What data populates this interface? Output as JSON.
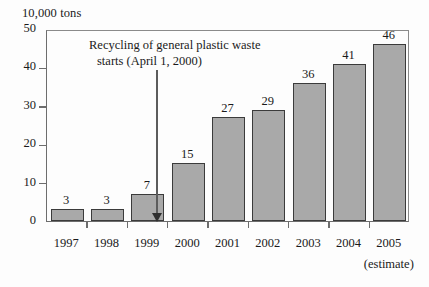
{
  "chart_data": {
    "type": "bar",
    "title": "",
    "xlabel": "",
    "ylabel": "10,000 tons",
    "categories": [
      "1997",
      "1998",
      "1999",
      "2000",
      "2001",
      "2002",
      "2003",
      "2004",
      "2005"
    ],
    "values": [
      3,
      3,
      7,
      15,
      27,
      29,
      36,
      41,
      46
    ],
    "ylim": [
      0,
      50
    ],
    "yticks": [
      0,
      10,
      20,
      30,
      40,
      50
    ],
    "grid": false,
    "legend": null,
    "bar_color": "#a9a9a9",
    "bar_border_color": "#3b3b3b",
    "axis_color": "#6d6d6d",
    "annotations": [
      {
        "line1": "Recycling of general plastic waste",
        "line2": "starts (April 1, 2000)",
        "points_to_category": "2000",
        "points_to_value": 0
      }
    ],
    "category_notes": [
      {
        "category": "2005",
        "note": "(estimate)"
      }
    ]
  },
  "axis": {
    "unit_label": "10,000 tons",
    "y_tick_labels": [
      "50",
      "40",
      "30",
      "20",
      "10",
      "0"
    ],
    "x_tick_labels": [
      "1997",
      "1998",
      "1999",
      "2000",
      "2001",
      "2002",
      "2003",
      "2004",
      "2005"
    ],
    "x_estimate_note": "(estimate)"
  },
  "bar_labels": [
    "3",
    "3",
    "7",
    "15",
    "27",
    "29",
    "36",
    "41",
    "46"
  ],
  "annotation": {
    "line1": "Recycling of general plastic waste",
    "line2": "starts (April 1, 2000)"
  }
}
